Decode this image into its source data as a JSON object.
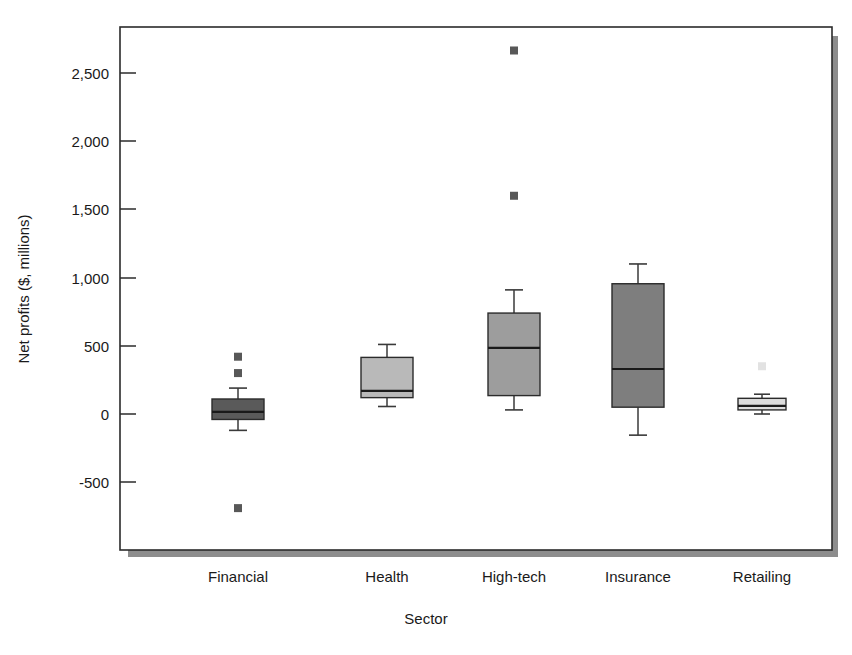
{
  "chart_data": {
    "type": "box",
    "title": "",
    "xlabel": "Sector",
    "ylabel": "Net profits ($, millions)",
    "categories": [
      "Financial",
      "Health",
      "High-tech",
      "Insurance",
      "Retailing"
    ],
    "ylim": [
      -870,
      2790
    ],
    "yticks": [
      2500,
      2000,
      1500,
      1000,
      500,
      0,
      -500
    ],
    "ytick_labels": [
      "2,500",
      "2,000",
      "1,500",
      "1,000",
      "500",
      "0",
      "-500"
    ],
    "grid": false,
    "legend": "none",
    "boxes": [
      {
        "category": "Financial",
        "whisker_low": -120,
        "q1": -40,
        "median": 15,
        "q3": 110,
        "whisker_high": 190,
        "outliers": [
          420,
          300,
          -690
        ],
        "fill": "#5a5a5a"
      },
      {
        "category": "Health",
        "whisker_low": 55,
        "q1": 120,
        "median": 170,
        "q3": 415,
        "whisker_high": 510,
        "outliers": [],
        "fill": "#b9b9b9"
      },
      {
        "category": "High-tech",
        "whisker_low": 30,
        "q1": 135,
        "median": 485,
        "q3": 740,
        "whisker_high": 910,
        "outliers": [
          2665,
          1600
        ],
        "fill": "#9d9d9d"
      },
      {
        "category": "Insurance",
        "whisker_low": -155,
        "q1": 50,
        "median": 330,
        "q3": 955,
        "whisker_high": 1100,
        "outliers": [],
        "fill": "#7e7e7e"
      },
      {
        "category": "Retailing",
        "whisker_low": 0,
        "q1": 30,
        "median": 60,
        "q3": 115,
        "whisker_high": 145,
        "outliers": [
          350
        ],
        "fill": "#dcdcdc"
      }
    ]
  },
  "axes": {
    "y_title": "Net profits ($, millions)",
    "x_title": "Sector",
    "tick_2500": "2,500",
    "tick_2000": "2,000",
    "tick_1500": "1,500",
    "tick_1000": "1,000",
    "tick_500": "500",
    "tick_0": "0",
    "tick_neg500": "-500"
  },
  "categories": {
    "c0": "Financial",
    "c1": "Health",
    "c2": "High-tech",
    "c3": "Insurance",
    "c4": "Retailing"
  },
  "colors": {
    "frame_stroke": "#2b2b2b",
    "shadow": "#8d8d8d",
    "text": "#1a1a1a",
    "box_financial": "#5a5a5a",
    "box_health": "#b9b9b9",
    "box_hightech": "#9d9d9d",
    "box_insurance": "#7e7e7e",
    "box_retailing": "#dcdcdc"
  }
}
